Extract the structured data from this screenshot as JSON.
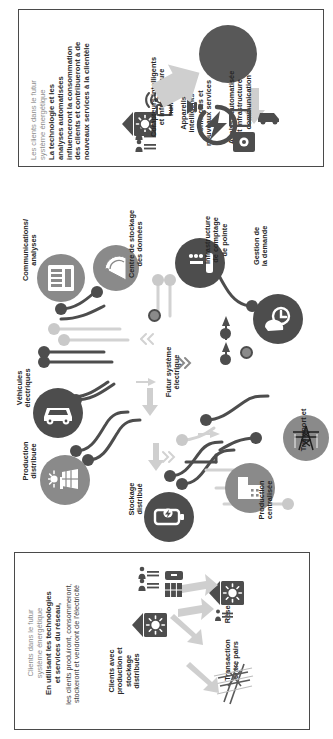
{
  "figure": {
    "language": "fr",
    "orientation": "rotated-90",
    "palette": {
      "dark": "#4d4d4d",
      "mid": "#8a8a8a",
      "light": "#c9c9c9",
      "title_gray": "#8d8d8d",
      "border": "#4a4a4a",
      "background": "#ffffff"
    }
  },
  "panel_top": {
    "title": "Les clients dans le futur\nsystème énergétique",
    "body": "La technologie et les\nanalyses automatisées\ninfluenceront la consommation\ndes clients et contribueront à de\nnouveaux services à la clientèle",
    "labels": {
      "smart_meters": "Compteurs intelligents\net infrastructure\nnumérique",
      "connected_devices": "Appareils\nintelligents\nconnectés et\nnouveaux services",
      "automated_analysis": "Analyse automatisée\net infrastructure\nde communication"
    }
  },
  "panel_bottom": {
    "title": "Clients dans le futur\nsystème énergétique",
    "body_bold": "En utilisant les technologies\net services du réseau,",
    "body_regular": "les clients produiront, consommeront,\nstockeront et vendront de l'électricité",
    "labels": {
      "customers": "Clients avec\nproduction et\nstockage\ndistribués",
      "peer_to_peer": "Transaction\nentre pairs",
      "grid": "Réseau"
    }
  },
  "diagram": {
    "center_label": "Futur système\nélectrique",
    "nodes": [
      {
        "id": "communications",
        "label": "Communications/\nanalyses",
        "icon": "server-rack-icon",
        "tone": "mid"
      },
      {
        "id": "data-center",
        "label": "Centre de stockage\ndes données",
        "icon": "satellite-dish-icon",
        "tone": "mid"
      },
      {
        "id": "ami",
        "label": "Infrastructure\nde comptage\nde pointe",
        "icon": "smart-meter-icon",
        "tone": "dark"
      },
      {
        "id": "demand-management",
        "label": "Gestion de\nla demande",
        "icon": "hand-switch-icon",
        "tone": "dark"
      },
      {
        "id": "electric-vehicles",
        "label": "Véhicules\nélectriques",
        "icon": "car-icon",
        "tone": "dark"
      },
      {
        "id": "distributed-generation",
        "label": "Production\ndistribuée",
        "icon": "solar-panel-icon",
        "tone": "mid"
      },
      {
        "id": "distributed-storage",
        "label": "Stockage\ndistribué",
        "icon": "battery-storage-icon",
        "tone": "dark"
      },
      {
        "id": "centralized-generation",
        "label": "Production\ncentralisée",
        "icon": "power-plant-icon",
        "tone": "mid"
      },
      {
        "id": "transmission",
        "label": "Transport et",
        "icon": "transmission-tower-icon",
        "tone": "mid"
      }
    ]
  }
}
